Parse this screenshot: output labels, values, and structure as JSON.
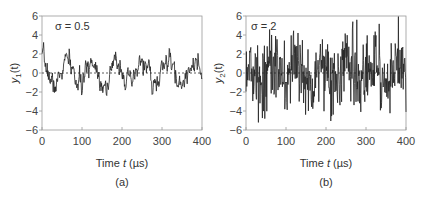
{
  "chart_data": [
    {
      "type": "line",
      "panel_label": "(a)",
      "annotation": "σ = 0.5",
      "xlabel": "Time t (µs)",
      "xlabel_parts": [
        "Time ",
        "t",
        " (µs)"
      ],
      "ylabel": "y1(t)",
      "ylabel_parts": [
        "y",
        "1",
        "(t)"
      ],
      "xlim": [
        0,
        400
      ],
      "ylim": [
        -6,
        6
      ],
      "xticks": [
        0,
        100,
        200,
        300,
        400
      ],
      "yticks": [
        -6,
        -4,
        -2,
        0,
        2,
        4,
        6
      ],
      "xtick_labels": [
        "0",
        "100",
        "200",
        "300",
        "400"
      ],
      "ytick_labels": [
        "−6",
        "−4",
        "−2",
        "0",
        "2",
        "4",
        "6"
      ],
      "zero_line": "dashed",
      "grid": false,
      "series": [
        {
          "name": "y1(t)",
          "color": "#222222",
          "generator": {
            "kind": "sine_plus_noise",
            "amplitude": 1.3,
            "period": 63,
            "phase_deg": 90,
            "noise_sigma": 0.5,
            "n_points": 400,
            "seed": 7
          }
        }
      ]
    },
    {
      "type": "line",
      "panel_label": "(b)",
      "annotation": "σ = 2",
      "xlabel": "Time t (µs)",
      "xlabel_parts": [
        "Time ",
        "t",
        " (µs)"
      ],
      "ylabel": "y2(t)",
      "ylabel_parts": [
        "y",
        "2",
        "(t)"
      ],
      "xlim": [
        0,
        400
      ],
      "ylim": [
        -6,
        6
      ],
      "xticks": [
        0,
        100,
        200,
        300,
        400
      ],
      "yticks": [
        -6,
        -4,
        -2,
        0,
        2,
        4,
        6
      ],
      "xtick_labels": [
        "0",
        "100",
        "200",
        "300",
        "400"
      ],
      "ytick_labels": [
        "−6",
        "−4",
        "−2",
        "0",
        "2",
        "4",
        "6"
      ],
      "zero_line": "dashed",
      "grid": false,
      "series": [
        {
          "name": "y2(t)",
          "color": "#222222",
          "generator": {
            "kind": "sine_plus_noise",
            "amplitude": 1.3,
            "period": 63,
            "phase_deg": 90,
            "noise_sigma": 2.0,
            "n_points": 400,
            "seed": 13,
            "clip": [
              -6,
              6
            ]
          }
        }
      ]
    }
  ]
}
